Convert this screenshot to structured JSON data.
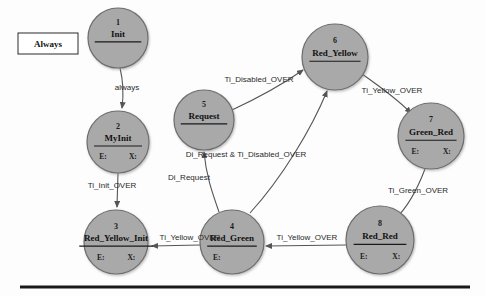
{
  "diagram": {
    "kind": "state-machine",
    "background_color": "#fdfdfd",
    "state_fill": "#a9a9a9",
    "state_stroke": "#6e6e6e",
    "edge_color": "#555555",
    "text_color": "#111111",
    "always_box": {
      "label": "Always",
      "x": 18,
      "y": 33,
      "width": 60,
      "height": 21
    },
    "baseline_rule": {
      "x1": 20,
      "x2": 470,
      "y": 287,
      "thickness": 3,
      "color": "#1a1a1a"
    },
    "states": [
      {
        "id": "1",
        "number": "1",
        "name": "Init",
        "cx": 118,
        "cy": 38,
        "r": 30,
        "entry_label": "",
        "exit_label": "",
        "has_slots": false
      },
      {
        "id": "2",
        "number": "2",
        "name": "MyInit",
        "cx": 118,
        "cy": 142,
        "r": 31,
        "entry_label": "E:",
        "exit_label": "X:",
        "has_slots": true
      },
      {
        "id": "3",
        "number": "3",
        "name": "Red_Yellow_Init",
        "cx": 116,
        "cy": 242,
        "r": 32,
        "entry_label": "E:",
        "exit_label": "X:",
        "has_slots": true
      },
      {
        "id": "4",
        "number": "4",
        "name": "Red_Green",
        "cx": 232,
        "cy": 242,
        "r": 32,
        "entry_label": "E:",
        "exit_label": "",
        "has_slots": true
      },
      {
        "id": "5",
        "number": "5",
        "name": "Request",
        "cx": 204,
        "cy": 120,
        "r": 30,
        "entry_label": "",
        "exit_label": "",
        "has_slots": false
      },
      {
        "id": "6",
        "number": "6",
        "name": "Red_Yellow",
        "cx": 335,
        "cy": 57,
        "r": 33,
        "entry_label": "",
        "exit_label": "",
        "has_slots": false
      },
      {
        "id": "7",
        "number": "7",
        "name": "Green_Red",
        "cx": 431,
        "cy": 136,
        "r": 33,
        "entry_label": "E:",
        "exit_label": "X:",
        "has_slots": true
      },
      {
        "id": "8",
        "number": "8",
        "name": "Red_Red",
        "cx": 380,
        "cy": 240,
        "r": 34,
        "entry_label": "E:",
        "exit_label": "X:",
        "has_slots": true
      }
    ],
    "transitions": [
      {
        "id": "t1",
        "from": "1",
        "to": "2",
        "label": "always",
        "label_x": 127,
        "label_y": 90,
        "path": "M 120 68 C 123 80 124 92 122 108"
      },
      {
        "id": "t2",
        "from": "2",
        "to": "3",
        "label": "Ti_Init_OVER",
        "label_x": 112,
        "label_y": 188,
        "path": "M 118 173 L 117 207"
      },
      {
        "id": "t3",
        "from": "4",
        "to": "3",
        "label": "Ti_Yellow_OVER",
        "label_x": 190,
        "label_y": 240,
        "path": "M 200 245 L 152 246"
      },
      {
        "id": "t4",
        "from": "4",
        "to": "5",
        "label": "Di_Request",
        "label_x": 189,
        "label_y": 180,
        "path": "M 219 212 C 212 192 206 175 204 152"
      },
      {
        "id": "t5",
        "from": "5",
        "to": "6",
        "label": "Ti_Disabled_OVER",
        "label_x": 259,
        "label_y": 82,
        "path": "M 232 110 C 262 96 286 82 303 70"
      },
      {
        "id": "t6",
        "from": "4",
        "to": "6",
        "label": "Di_Request & Ti_Disabled_OVER",
        "label_x": 246,
        "label_y": 157,
        "path": "M 250 213 C 282 178 312 128 327 91"
      },
      {
        "id": "t7",
        "from": "6",
        "to": "7",
        "label": "Ti_Yellow_OVER",
        "label_x": 392,
        "label_y": 93,
        "path": "M 362 74 C 382 88 398 100 411 113"
      },
      {
        "id": "t8",
        "from": "7",
        "to": "8",
        "label": "Ti_Green_OVER",
        "label_x": 418,
        "label_y": 193,
        "path": "M 425 169 C 417 190 407 208 395 219"
      },
      {
        "id": "t9",
        "from": "8",
        "to": "4",
        "label": "Ti_Yellow_OVER",
        "label_x": 307,
        "label_y": 240,
        "path": "M 346 245 L 266 246"
      }
    ]
  }
}
